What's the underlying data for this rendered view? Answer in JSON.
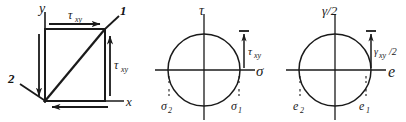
{
  "figure": {
    "width": 406,
    "height": 122,
    "ink_color": "#1a1a1a",
    "background": "#ffffff"
  },
  "panel_element": {
    "name": "stress-element",
    "axis_y_label": "y",
    "axis_x_label": "x",
    "corner_1_label": "1",
    "corner_2_label": "2",
    "shear_top_label": "τ",
    "shear_top_sub": "xy",
    "shear_right_label": "τ",
    "shear_right_sub": "xy"
  },
  "panel_stress_circle": {
    "name": "mohr-circle-stress",
    "vertical_axis_label": "τ",
    "horizontal_axis_label": "σ",
    "radius_label": "τ",
    "radius_sub": "xy",
    "left_intercept_label": "σ",
    "left_intercept_sub": "2",
    "right_intercept_label": "σ",
    "right_intercept_sub": "1",
    "center_x": 204,
    "center_y": 70,
    "radius": 36
  },
  "panel_strain_circle": {
    "name": "mohr-circle-strain",
    "vertical_axis_label": "γ/2",
    "horizontal_axis_label": "e",
    "radius_label": "γ",
    "radius_sub": "xy",
    "radius_suffix": "/2",
    "left_intercept_label": "e",
    "left_intercept_sub": "2",
    "right_intercept_label": "e",
    "right_intercept_sub": "1",
    "center_x": 335,
    "center_y": 70,
    "radius": 36
  }
}
